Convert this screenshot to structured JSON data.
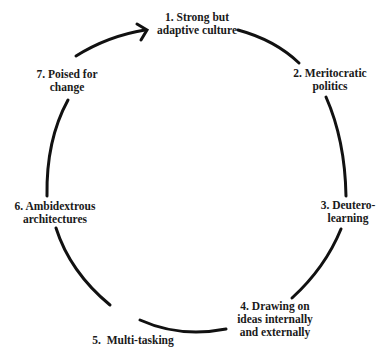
{
  "diagram": {
    "type": "cycle",
    "direction": "clockwise",
    "stroke_color": "#111111",
    "text_color": "#1a1a1a",
    "background": "#ffffff",
    "nodes": [
      {
        "id": 1,
        "line1": "1. Strong but",
        "line2": "adaptive culture",
        "line3": ""
      },
      {
        "id": 2,
        "line1": "2. Meritocratic",
        "line2": "politics",
        "line3": ""
      },
      {
        "id": 3,
        "line1": "3. Deutero-",
        "line2": "learning",
        "line3": ""
      },
      {
        "id": 4,
        "line1": "4. Drawing on",
        "line2": "ideas internally",
        "line3": "and externally"
      },
      {
        "id": 5,
        "line1": "5.  Multi-tasking",
        "line2": "",
        "line3": ""
      },
      {
        "id": 6,
        "line1": "6. Ambidextrous",
        "line2": "architectures",
        "line3": ""
      },
      {
        "id": 7,
        "line1": "7. Poised for",
        "line2": "change",
        "line3": ""
      }
    ],
    "connectors": [
      {
        "from": 1,
        "to": 2
      },
      {
        "from": 2,
        "to": 3
      },
      {
        "from": 3,
        "to": 4
      },
      {
        "from": 4,
        "to": 5
      },
      {
        "from": 5,
        "to": 6
      },
      {
        "from": 6,
        "to": 7
      },
      {
        "from": 7,
        "to": 1,
        "arrowhead": true
      }
    ]
  }
}
